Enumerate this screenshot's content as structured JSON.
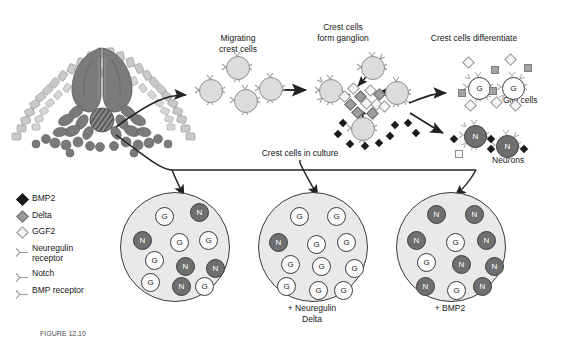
{
  "figure": {
    "title_visible": false,
    "caption_partial": "FIGURE 12.10",
    "background": "#ffffff"
  },
  "stage_labels": {
    "migrating": "Migrating\ncrest cells",
    "ganglion": "Crest cells\nform ganglion",
    "differentiate": "Crest cells differentiate",
    "glia": "Glia cells",
    "neurons": "Neurons",
    "culture": "Crest cells in culture"
  },
  "legend": {
    "items": [
      {
        "label": "BMP2",
        "icon": "black-diamond-icon",
        "color": "#1b1b1b"
      },
      {
        "label": "Delta",
        "icon": "gray-diamond-icon",
        "color": "#9a9a9a"
      },
      {
        "label": "GGF2",
        "icon": "white-diamond-icon",
        "color": "#f4f4f4"
      },
      {
        "label": "Neuregulin\nreceptor",
        "icon": "receptor-icon",
        "color": "#8d8d8d"
      },
      {
        "label": "Notch",
        "icon": "receptor-icon",
        "color": "#8d8d8d"
      },
      {
        "label": "BMP receptor",
        "icon": "receptor-icon",
        "color": "#8d8d8d"
      }
    ]
  },
  "embryo": {
    "name": "neural-tube-cross-section",
    "parts": [
      "ectoderm",
      "neural-tube",
      "neural-crest-cells",
      "notochord",
      "somite"
    ]
  },
  "cells": {
    "crest_label": "",
    "glia_label": "G",
    "neuron_label": "N"
  },
  "migrating_cells": {
    "count": 4,
    "type": "crest"
  },
  "ganglion": {
    "crest_count": 4,
    "delta_count": 5,
    "ggf2_count": 6,
    "bmp2_count": 9
  },
  "differentiated": {
    "glia_count": 2,
    "neuron_count": 2,
    "glia_label": "G",
    "neuron_label": "N"
  },
  "dishes": [
    {
      "name": "control-dish",
      "label": "",
      "glia_count": 7,
      "neuron_count": 5,
      "cells": [
        {
          "t": "g",
          "x": 34,
          "y": 14
        },
        {
          "t": "n",
          "x": 69,
          "y": 10
        },
        {
          "t": "n",
          "x": 12,
          "y": 38
        },
        {
          "t": "g",
          "x": 49,
          "y": 40
        },
        {
          "t": "g",
          "x": 78,
          "y": 38
        },
        {
          "t": "g",
          "x": 24,
          "y": 58
        },
        {
          "t": "n",
          "x": 55,
          "y": 64
        },
        {
          "t": "n",
          "x": 85,
          "y": 66
        },
        {
          "t": "g",
          "x": 20,
          "y": 80
        },
        {
          "t": "n",
          "x": 51,
          "y": 84
        },
        {
          "t": "g",
          "x": 74,
          "y": 84
        }
      ]
    },
    {
      "name": "neuregulin-delta-dish",
      "label": "+ Neuregulin\nDelta",
      "glia_count": 11,
      "neuron_count": 1,
      "cells": [
        {
          "t": "g",
          "x": 31,
          "y": 14
        },
        {
          "t": "g",
          "x": 68,
          "y": 14
        },
        {
          "t": "n",
          "x": 10,
          "y": 40
        },
        {
          "t": "g",
          "x": 48,
          "y": 42
        },
        {
          "t": "g",
          "x": 78,
          "y": 40
        },
        {
          "t": "g",
          "x": 22,
          "y": 62
        },
        {
          "t": "g",
          "x": 53,
          "y": 64
        },
        {
          "t": "g",
          "x": 86,
          "y": 66
        },
        {
          "t": "g",
          "x": 18,
          "y": 84
        },
        {
          "t": "g",
          "x": 50,
          "y": 88
        },
        {
          "t": "g",
          "x": 75,
          "y": 88
        }
      ]
    },
    {
      "name": "bmp2-dish",
      "label": "+ BMP2",
      "glia_count": 3,
      "neuron_count": 8,
      "cells": [
        {
          "t": "n",
          "x": 30,
          "y": 12
        },
        {
          "t": "n",
          "x": 68,
          "y": 12
        },
        {
          "t": "n",
          "x": 10,
          "y": 38
        },
        {
          "t": "g",
          "x": 49,
          "y": 40
        },
        {
          "t": "n",
          "x": 80,
          "y": 38
        },
        {
          "t": "g",
          "x": 20,
          "y": 60
        },
        {
          "t": "n",
          "x": 55,
          "y": 62
        },
        {
          "t": "n",
          "x": 88,
          "y": 64
        },
        {
          "t": "n",
          "x": 19,
          "y": 84
        },
        {
          "t": "g",
          "x": 50,
          "y": 88
        },
        {
          "t": "n",
          "x": 76,
          "y": 84
        }
      ]
    }
  ]
}
